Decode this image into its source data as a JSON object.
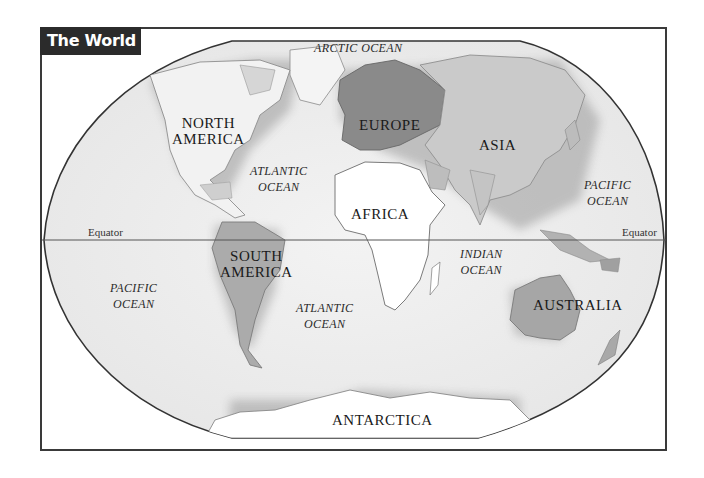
{
  "title": "The World",
  "colors": {
    "frame_border": "#3a3a3a",
    "title_bg": "#2b2b2b",
    "title_text": "#ffffff",
    "ocean_fill": "#ececec",
    "land_light": "#f7f7f7",
    "land_mid": "#bdbdbd",
    "europe_fill": "#8a8a8a",
    "asia_fill": "#c8c8c8",
    "south_america_fill": "#a9a9a9",
    "australia_fill": "#a6a6a6",
    "africa_fill": "#ffffff",
    "antarctica_fill": "#ffffff"
  },
  "continents": {
    "north_america": [
      "NORTH",
      "AMERICA"
    ],
    "south_america": [
      "SOUTH",
      "AMERICA"
    ],
    "europe": "EUROPE",
    "asia": "ASIA",
    "africa": "AFRICA",
    "australia": "AUSTRALIA",
    "antarctica": "ANTARCTICA"
  },
  "oceans": {
    "arctic": "ARCTIC OCEAN",
    "atlantic_north": [
      "ATLANTIC",
      "OCEAN"
    ],
    "atlantic_south": [
      "ATLANTIC",
      "OCEAN"
    ],
    "pacific_west": [
      "PACIFIC",
      "OCEAN"
    ],
    "pacific_east": [
      "PACIFIC",
      "OCEAN"
    ],
    "indian": [
      "INDIAN",
      "OCEAN"
    ]
  },
  "lines": {
    "equator_left": "Equator",
    "equator_right": "Equator"
  }
}
